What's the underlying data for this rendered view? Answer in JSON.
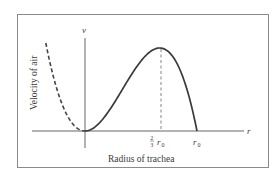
{
  "chart_data": {
    "type": "line",
    "title": "",
    "xlabel": "Radius of trachea",
    "ylabel": "Velocity of air",
    "x_axis_symbol": "r",
    "y_axis_symbol": "v",
    "x_ticks": [
      {
        "label_frac": "2/3",
        "label_var": "r0",
        "value": 0.6667
      },
      {
        "label_var": "r0",
        "value": 1.0
      }
    ],
    "annotations": [
      {
        "type": "dashed-vertical-line",
        "at_x": 0.6667,
        "note": "maximum velocity at r = (2/3) r0"
      },
      {
        "type": "dashed-curve-segment",
        "x_range": [
          -0.35,
          0
        ],
        "note": "non-physical part of cubic (r < 0)"
      }
    ],
    "series": [
      {
        "name": "v(r) = k(r0 - r) r^2",
        "style": "solid",
        "x": [
          0,
          0.1,
          0.2,
          0.3,
          0.4,
          0.5,
          0.6,
          0.6667,
          0.75,
          0.85,
          0.95,
          1.0
        ],
        "y": [
          0,
          0.061,
          0.216,
          0.425,
          0.648,
          0.844,
          0.972,
          1.0,
          0.949,
          0.732,
          0.305,
          0
        ]
      },
      {
        "name": "extension for r < 0",
        "style": "dashed",
        "x": [
          -0.35,
          -0.3,
          -0.2,
          -0.1,
          0
        ],
        "y": [
          1.0,
          0.81,
          0.36,
          0.1,
          0
        ]
      }
    ],
    "xlim": [
      -0.45,
      1.5
    ],
    "ylim": [
      -0.4,
      1.15
    ],
    "grid": false,
    "legend": null
  },
  "labels": {
    "y_axis_symbol": "v",
    "x_axis_symbol": "r",
    "ylabel": "Velocity of air",
    "xlabel": "Radius of trachea",
    "tick_two_thirds_num": "2",
    "tick_two_thirds_den": "3",
    "tick_r0_r": "r",
    "tick_r0_sub": "0"
  }
}
